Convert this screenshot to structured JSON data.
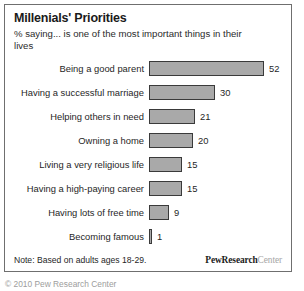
{
  "figure": {
    "title": "Millenials' Priorities",
    "subtitle": "% saying... is one of the most important things in their lives",
    "note": "Note: Based on adults ages 18-29.",
    "brand_bold": "PewResearch",
    "brand_light": "Center",
    "copyright": "© 2010 Pew Research Center"
  },
  "colors": {
    "bar_fill": "#a9a9a9",
    "bar_border": "#3a3a3a",
    "frame_border": "#6f6f6f",
    "text": "#1f1f1f",
    "brand_light": "#a6a6a6"
  },
  "chart_data": {
    "type": "bar",
    "orientation": "horizontal",
    "title": "Millenials' Priorities",
    "subtitle": "% saying... is one of the most important things in their lives",
    "xlabel": "",
    "ylabel": "",
    "xlim": [
      0,
      52
    ],
    "grid": false,
    "legend": false,
    "value_labels": true,
    "note": "Note: Based on adults ages 18-29.",
    "source": "PewResearch Center",
    "categories": [
      "Being a good parent",
      "Having a successful marriage",
      "Helping others in need",
      "Owning a home",
      "Living a very religious life",
      "Having a high-paying career",
      "Having lots of free time",
      "Becoming famous"
    ],
    "values": [
      52,
      30,
      21,
      20,
      15,
      15,
      9,
      1
    ],
    "bars": [
      {
        "label": "Being a good parent",
        "value": 52,
        "value_text": "52"
      },
      {
        "label": "Having a successful marriage",
        "value": 30,
        "value_text": "30"
      },
      {
        "label": "Helping others in need",
        "value": 21,
        "value_text": "21"
      },
      {
        "label": "Owning a home",
        "value": 20,
        "value_text": "20"
      },
      {
        "label": "Living a very religious life",
        "value": 15,
        "value_text": "15"
      },
      {
        "label": "Having a high-paying career",
        "value": 15,
        "value_text": "15"
      },
      {
        "label": "Having lots of free time",
        "value": 9,
        "value_text": "9"
      },
      {
        "label": "Becoming famous",
        "value": 1,
        "value_text": "1"
      }
    ]
  }
}
